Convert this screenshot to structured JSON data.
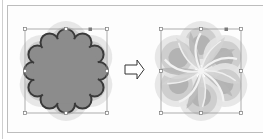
{
  "figure": {
    "panels": [
      {
        "id": "before",
        "label": "Scalloped flower with selection bounding box",
        "fill": "#8c8c8c",
        "stroke": "#3a3a3a"
      },
      {
        "id": "after",
        "label": "Twirled flower result with selection bounding box"
      }
    ],
    "arrow": {
      "direction": "right",
      "icon": "arrow-right-outline-icon"
    },
    "colors": {
      "petal_light": "#e6e6e6",
      "petal_mid": "#c9c9c9",
      "petal_dark": "#a6a6a6",
      "petal_darker": "#8f8f8f",
      "flower_fill": "#8c8c8c",
      "outline": "#3a3a3a",
      "bbox": "#9a9a9a",
      "handle": "#ffffff",
      "handle_dark": "#7a7a7a"
    }
  }
}
